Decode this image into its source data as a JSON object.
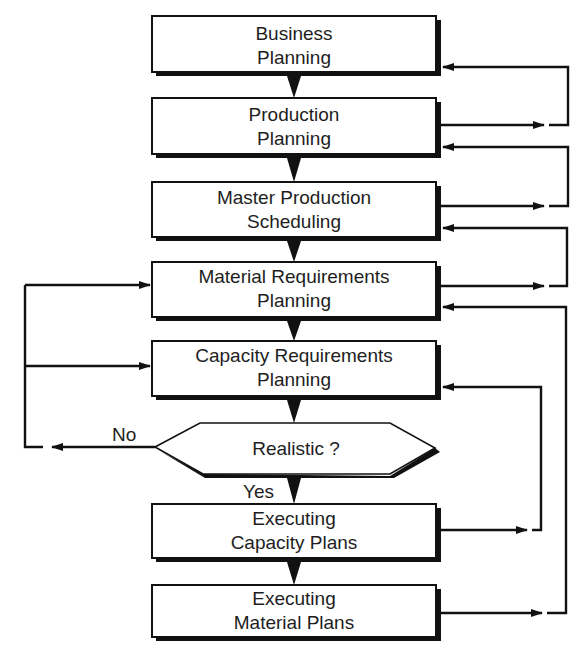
{
  "diagram": {
    "type": "flowchart",
    "colors": {
      "line": "#111111",
      "box_fill": "#ffffff",
      "text": "#1e1e1e",
      "background": "#ffffff"
    },
    "nodes": [
      {
        "id": "business-planning",
        "line1": "Business",
        "line2": "Planning"
      },
      {
        "id": "production-planning",
        "line1": "Production",
        "line2": "Planning"
      },
      {
        "id": "master-production-scheduling",
        "line1": "Master Production",
        "line2": "Scheduling"
      },
      {
        "id": "material-requirements-planning",
        "line1": "Material Requirements",
        "line2": "Planning"
      },
      {
        "id": "capacity-requirements-planning",
        "line1": "Capacity Requirements",
        "line2": "Planning"
      },
      {
        "id": "realistic-decision",
        "label": "Realistic ?"
      },
      {
        "id": "executing-capacity-plans",
        "line1": "Executing",
        "line2": "Capacity Plans"
      },
      {
        "id": "executing-material-plans",
        "line1": "Executing",
        "line2": "Material Plans"
      }
    ],
    "edge_labels": {
      "no": "No",
      "yes": "Yes"
    },
    "edges": [
      {
        "from": "business-planning",
        "to": "production-planning"
      },
      {
        "from": "production-planning",
        "to": "master-production-scheduling"
      },
      {
        "from": "master-production-scheduling",
        "to": "material-requirements-planning"
      },
      {
        "from": "material-requirements-planning",
        "to": "capacity-requirements-planning"
      },
      {
        "from": "capacity-requirements-planning",
        "to": "realistic-decision"
      },
      {
        "from": "realistic-decision",
        "to": "executing-capacity-plans",
        "label": "Yes"
      },
      {
        "from": "executing-capacity-plans",
        "to": "executing-material-plans"
      },
      {
        "from": "realistic-decision",
        "to": "material-requirements-planning",
        "label": "No"
      },
      {
        "from": "realistic-decision",
        "to": "capacity-requirements-planning",
        "label": "No"
      },
      {
        "from": "production-planning",
        "to": "business-planning",
        "type": "feedback"
      },
      {
        "from": "master-production-scheduling",
        "to": "production-planning",
        "type": "feedback"
      },
      {
        "from": "material-requirements-planning",
        "to": "master-production-scheduling",
        "type": "feedback"
      },
      {
        "from": "executing-material-plans",
        "to": "material-requirements-planning",
        "type": "feedback"
      },
      {
        "from": "executing-capacity-plans",
        "to": "capacity-requirements-planning",
        "type": "feedback"
      }
    ]
  }
}
